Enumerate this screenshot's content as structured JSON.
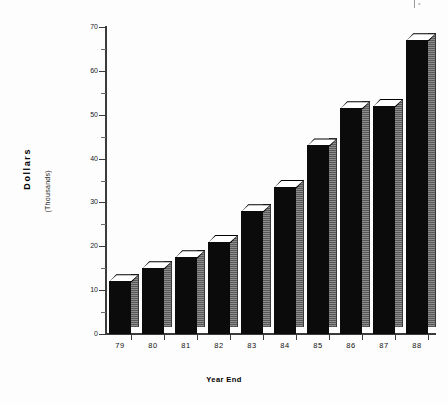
{
  "chart_data": {
    "type": "bar",
    "title": "",
    "subtitle": "",
    "xlabel": "Year End",
    "ylabel": "Dollars",
    "ylabel_secondary": "(Thousands)",
    "categories": [
      "79",
      "80",
      "81",
      "82",
      "83",
      "84",
      "85",
      "86",
      "87",
      "88"
    ],
    "values": [
      12,
      15,
      17.5,
      21,
      28,
      33.5,
      43,
      51.5,
      52,
      67
    ],
    "series": [
      {
        "name": "Dollars (Thousands)",
        "values": [
          12,
          15,
          17.5,
          21,
          28,
          33.5,
          43,
          51.5,
          52,
          67
        ]
      }
    ],
    "ylim": [
      0,
      70
    ],
    "y_ticks": [
      0,
      10,
      20,
      30,
      40,
      50,
      60,
      70
    ],
    "y_tick_labels": [
      "0",
      "10",
      "20",
      "30",
      "40",
      "50",
      "60",
      "70"
    ],
    "y_minor_ticks": [
      5,
      15,
      25,
      35,
      45,
      55,
      65
    ],
    "grid": false,
    "legend": false,
    "legend_position": "none",
    "style": "3d-bar",
    "colors": {
      "bar_front": "#0b0b0b",
      "bar_side": "#6e6e6e",
      "bar_top": "#ffffff",
      "axis": "#3b3b3b",
      "text": "#111111",
      "background": "#fdfdfd"
    }
  },
  "artifact": {
    "corner_mark": "•"
  }
}
